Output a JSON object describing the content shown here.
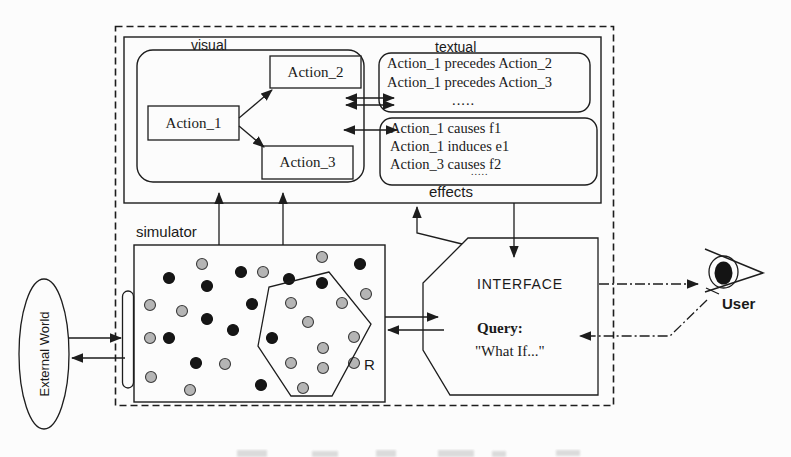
{
  "figure": {
    "regions": {
      "visual_label": "visual",
      "textual_label": "textual",
      "effects_label": "effects",
      "simulator_label": "simulator",
      "region_label": "R"
    },
    "actions": [
      "Action_1",
      "Action_2",
      "Action_3"
    ],
    "precedence_rules": [
      "Action_1 precedes Action_2",
      "Action_1 precedes Action_3",
      "....."
    ],
    "effect_rules": [
      "Action_1 causes f1",
      "Action_1 induces e1",
      "Action_3 causes f2",
      "....."
    ],
    "interface": {
      "title": "INTERFACE",
      "query_label": "Query:",
      "query_text": "\"What If...\""
    },
    "user_label": "User",
    "external_world_label": "External World",
    "simulator_dots": {
      "black": [
        [
          169,
          278
        ],
        [
          207,
          286
        ],
        [
          241,
          272
        ],
        [
          289,
          279
        ],
        [
          322,
          283
        ],
        [
          360,
          264
        ],
        [
          252,
          304
        ],
        [
          207,
          319
        ],
        [
          233,
          330
        ],
        [
          169,
          338
        ],
        [
          272,
          338
        ],
        [
          196,
          363
        ],
        [
          261,
          385
        ]
      ],
      "gray": [
        [
          202,
          264
        ],
        [
          263,
          272
        ],
        [
          322,
          257
        ],
        [
          150,
          305
        ],
        [
          182,
          311
        ],
        [
          291,
          303
        ],
        [
          342,
          303
        ],
        [
          308,
          322
        ],
        [
          366,
          294
        ],
        [
          150,
          338
        ],
        [
          354,
          337
        ],
        [
          323,
          348
        ],
        [
          151,
          377
        ],
        [
          225,
          364
        ],
        [
          291,
          363
        ],
        [
          323,
          368
        ],
        [
          354,
          363
        ],
        [
          190,
          390
        ],
        [
          303,
          388
        ]
      ]
    },
    "colors": {
      "ink": "#1d1d1d",
      "dot_black": "#161616",
      "dot_gray": "#b5b5b5",
      "paper": "#fcfcfc"
    }
  }
}
